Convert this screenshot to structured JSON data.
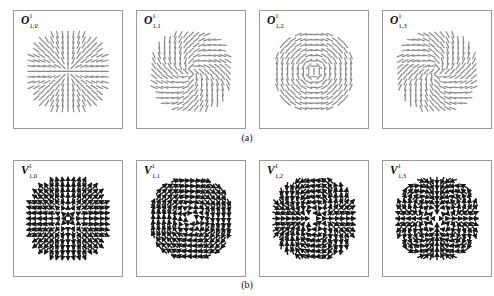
{
  "figure": {
    "background_color": "#ffffff",
    "panel_border_color": "#9a9a9a",
    "rows": [
      {
        "id": "row-a",
        "caption": "(a)",
        "glyph_style": "line-segment",
        "glyph_color": "#8c8c8c",
        "panels": [
          {
            "symbol": "O",
            "superscript": "1",
            "subscript": "1,0",
            "label": "O¹₁,₀",
            "mode_m": 0,
            "kind": "orientation",
            "mask": "circle"
          },
          {
            "symbol": "O",
            "superscript": "1",
            "subscript": "1,1",
            "label": "O¹₁,₁",
            "mode_m": 1,
            "kind": "orientation",
            "mask": "circle"
          },
          {
            "symbol": "O",
            "superscript": "1",
            "subscript": "1,2",
            "label": "O¹₁,₂",
            "mode_m": 2,
            "kind": "orientation",
            "mask": "circle"
          },
          {
            "symbol": "O",
            "superscript": "1",
            "subscript": "1,3",
            "label": "O¹₁,₃",
            "mode_m": 3,
            "kind": "orientation",
            "mask": "circle"
          }
        ]
      },
      {
        "id": "row-b",
        "caption": "(b)",
        "glyph_style": "arrow",
        "glyph_color": "#1a1a1a",
        "panels": [
          {
            "symbol": "V",
            "superscript": "1",
            "subscript": "1,0",
            "label": "V¹₁,₀",
            "mode_m": 0,
            "kind": "radial",
            "mask": "circle"
          },
          {
            "symbol": "V",
            "superscript": "1",
            "subscript": "1,1",
            "label": "V¹₁,₁",
            "mode_m": 1,
            "kind": "azimuthal",
            "mask": "circle"
          },
          {
            "symbol": "V",
            "superscript": "1",
            "subscript": "1,2",
            "label": "V¹₁,₂",
            "mode_m": 2,
            "kind": "quadrupolar",
            "mask": "circle"
          },
          {
            "symbol": "V",
            "superscript": "1",
            "subscript": "1,3",
            "label": "V¹₁,₃",
            "mode_m": 3,
            "kind": "hexapolar",
            "mask": "circle"
          }
        ]
      }
    ]
  },
  "chart_data": {
    "type": "scatter",
    "xlabel": "",
    "ylabel": "",
    "grid": false,
    "legend": null,
    "panel_grid_rows": 2,
    "panel_grid_cols": 4,
    "sample_grid": "17 x 17 lattice sampled inside unit disk",
    "radius_normalized": 1.0,
    "series": [
      {
        "name": "O¹₁,₀",
        "row": "a",
        "mode_m": 0,
        "formula": "theta(x,y) = atan2(y,x) rendered as unoriented line segment",
        "glyph": "segment",
        "color": "#8c8c8c"
      },
      {
        "name": "O¹₁,₁",
        "row": "a",
        "mode_m": 1,
        "formula": "theta(x,y) = atan2(y,x) + phi_1",
        "glyph": "segment",
        "color": "#8c8c8c"
      },
      {
        "name": "O¹₁,₂",
        "row": "a",
        "mode_m": 2,
        "formula": "theta(x,y) = atan2(y,x) + phi_2",
        "glyph": "segment",
        "color": "#8c8c8c"
      },
      {
        "name": "O¹₁,₃",
        "row": "a",
        "mode_m": 3,
        "formula": "theta(x,y) = atan2(y,x) + phi_3",
        "glyph": "segment",
        "color": "#8c8c8c"
      },
      {
        "name": "V¹₁,₀",
        "row": "b",
        "mode_m": 0,
        "formula": "V = r_hat (radial outward)",
        "glyph": "arrow",
        "color": "#1a1a1a"
      },
      {
        "name": "V¹₁,₁",
        "row": "b",
        "mode_m": 1,
        "formula": "V = theta_hat (azimuthal / rotational)",
        "glyph": "arrow",
        "color": "#1a1a1a"
      },
      {
        "name": "V¹₁,₂",
        "row": "b",
        "mode_m": 2,
        "formula": "V = (cos(2t), sin(2t)) quadrupolar",
        "glyph": "arrow",
        "color": "#1a1a1a"
      },
      {
        "name": "V¹₁,₃",
        "row": "b",
        "mode_m": 3,
        "formula": "V = (cos(3t), sin(3t)) hexapolar",
        "glyph": "arrow",
        "color": "#1a1a1a"
      }
    ],
    "captions": [
      "(a)",
      "(b)"
    ]
  }
}
